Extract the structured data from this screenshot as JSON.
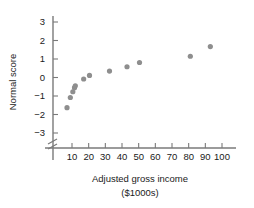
{
  "chart_data": {
    "type": "scatter",
    "title": "",
    "xlabel": "Adjusted gross income",
    "xlabel_units": "($1000s)",
    "ylabel": "Normal score",
    "xlim": [
      0,
      105
    ],
    "ylim": [
      -3.6,
      3.4
    ],
    "xticks": [
      10,
      20,
      30,
      40,
      50,
      60,
      70,
      80,
      90,
      100
    ],
    "yticks": [
      3,
      2,
      1,
      0,
      -1,
      -2,
      -3
    ],
    "xtick_labels": [
      "10",
      "20",
      "30",
      "40",
      "50",
      "60",
      "70",
      "80",
      "90",
      "100"
    ],
    "ytick_labels": [
      "3",
      "2",
      "1",
      "0",
      "−1",
      "−2",
      "−3"
    ],
    "grid": false,
    "legend": null,
    "axis_break": {
      "axis": "y",
      "label": "break-below-minus-three",
      "position": -3.4
    },
    "point_color": "#8e8e8e",
    "axis_color": "#7a7a7a",
    "text_color": "#1a1a1a",
    "points": [
      {
        "x": 7.0,
        "y": -1.63
      },
      {
        "x": 9.0,
        "y": -1.08
      },
      {
        "x": 10.5,
        "y": -0.77
      },
      {
        "x": 11.5,
        "y": -0.55
      },
      {
        "x": 12.0,
        "y": -0.45
      },
      {
        "x": 17.0,
        "y": -0.08
      },
      {
        "x": 20.5,
        "y": 0.11
      },
      {
        "x": 32.5,
        "y": 0.35
      },
      {
        "x": 43.0,
        "y": 0.58
      },
      {
        "x": 50.5,
        "y": 0.81
      },
      {
        "x": 81.0,
        "y": 1.15
      },
      {
        "x": 93.0,
        "y": 1.67
      }
    ]
  }
}
